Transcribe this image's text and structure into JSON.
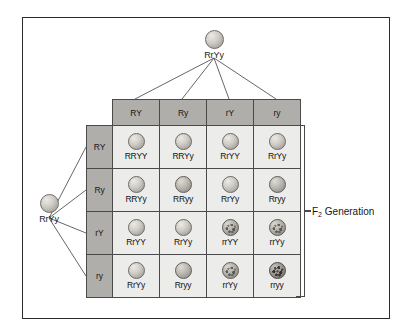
{
  "figure": {
    "border_color": "#2b2b2b",
    "background": "#ffffff"
  },
  "parents": {
    "top": {
      "genotype": "RrYy",
      "seed_shape": "round",
      "seed_color": "yellow"
    },
    "left": {
      "genotype": "RrYy",
      "seed_shape": "round",
      "seed_color": "yellow"
    }
  },
  "punnett": {
    "column_gametes": [
      "RY",
      "Ry",
      "rY",
      "ry"
    ],
    "row_gametes": [
      "RY",
      "Ry",
      "rY",
      "ry"
    ],
    "header_color": "#b0aeaa",
    "cell_color": "#ececea",
    "grid_line_color": "#4a4a4a",
    "rows": [
      {
        "gamete": "RY",
        "cells": [
          {
            "genotype": "RRYY",
            "shape": "round",
            "color": "yellow"
          },
          {
            "genotype": "RRYy",
            "shape": "round",
            "color": "yellow"
          },
          {
            "genotype": "RrYY",
            "shape": "round",
            "color": "yellow"
          },
          {
            "genotype": "RrYy",
            "shape": "round",
            "color": "yellow"
          }
        ]
      },
      {
        "gamete": "Ry",
        "cells": [
          {
            "genotype": "RRYy",
            "shape": "round",
            "color": "yellow"
          },
          {
            "genotype": "RRyy",
            "shape": "round",
            "color": "green"
          },
          {
            "genotype": "RrYy",
            "shape": "round",
            "color": "yellow"
          },
          {
            "genotype": "Rryy",
            "shape": "round",
            "color": "green"
          }
        ]
      },
      {
        "gamete": "rY",
        "cells": [
          {
            "genotype": "RrYY",
            "shape": "round",
            "color": "yellow"
          },
          {
            "genotype": "RrYy",
            "shape": "round",
            "color": "yellow"
          },
          {
            "genotype": "rrYY",
            "shape": "wrinkled",
            "color": "yellow"
          },
          {
            "genotype": "rrYy",
            "shape": "wrinkled",
            "color": "yellow"
          }
        ]
      },
      {
        "gamete": "ry",
        "cells": [
          {
            "genotype": "RrYy",
            "shape": "round",
            "color": "yellow"
          },
          {
            "genotype": "Rryy",
            "shape": "round",
            "color": "green"
          },
          {
            "genotype": "rrYy",
            "shape": "wrinkled",
            "color": "yellow"
          },
          {
            "genotype": "rryy",
            "shape": "wrinkled",
            "color": "green"
          }
        ]
      }
    ]
  },
  "annotations": {
    "f2_label_prefix": "F",
    "f2_label_subscript": "2",
    "f2_label_suffix": " Generation"
  }
}
